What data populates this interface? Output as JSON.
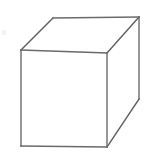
{
  "figure": {
    "title": "Cube wireframe line drawing",
    "shape_name": "cube",
    "background_color": "#ffffff",
    "canvas": {
      "width": 150,
      "height": 154
    },
    "style": {
      "stroke_color": "#6b6b6b",
      "stroke_color_dark": "#575757",
      "fill_color": "#ffffff",
      "stroke_width": 1.4
    },
    "vertices": {
      "front_top_left": {
        "label": "A",
        "x": 21,
        "y": 50
      },
      "front_top_right": {
        "label": "B",
        "x": 107,
        "y": 53
      },
      "front_bottom_right": {
        "label": "C",
        "x": 107,
        "y": 147
      },
      "front_bottom_left": {
        "label": "D",
        "x": 21,
        "y": 146
      },
      "back_top_left": {
        "label": "E",
        "x": 53,
        "y": 18
      },
      "back_top_right": {
        "label": "F",
        "x": 139,
        "y": 17
      },
      "back_bottom_right": {
        "label": "G",
        "x": 139,
        "y": 99
      }
    },
    "faces": {
      "front": {
        "name": "front-face",
        "points": "21,50 107,53 107,147 21,146"
      },
      "top": {
        "name": "top-face",
        "points": "21,50 53,18 139,17 107,53"
      },
      "right": {
        "name": "right-face",
        "points": "107,53 139,17 139,99 107,147"
      }
    },
    "edges": [
      {
        "name": "front-top-edge",
        "d": "M21,50 L107,53"
      },
      {
        "name": "front-right-edge",
        "d": "M107,53 L107,147"
      },
      {
        "name": "front-bottom-edge",
        "d": "M107,147 L21,146"
      },
      {
        "name": "front-left-edge",
        "d": "M21,146 L21,50"
      },
      {
        "name": "top-left-receding-edge",
        "d": "M21,50 L53,18"
      },
      {
        "name": "top-back-edge",
        "d": "M53,18 L139,17"
      },
      {
        "name": "top-right-receding-edge",
        "d": "M139,17 L107,53"
      },
      {
        "name": "right-back-vertical-edge",
        "d": "M139,17 L139,99"
      },
      {
        "name": "right-bottom-receding-edge",
        "d": "M139,99 L107,147"
      }
    ],
    "artifact": {
      "name": "scan-speck",
      "visible": true,
      "x": 2,
      "y": 30,
      "color": "#f2f2f2"
    }
  }
}
